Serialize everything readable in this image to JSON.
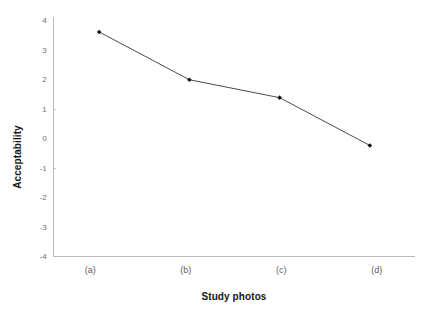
{
  "chart_data": {
    "type": "line",
    "title": "",
    "subtitle": "",
    "xlabel": "Study photos",
    "ylabel": "Acceptability",
    "categories": [
      "(a)",
      "(b)",
      "(c)",
      "(d)"
    ],
    "values": [
      3.5,
      1.9,
      1.3,
      -0.3
    ],
    "series": [
      {
        "name": "Acceptability",
        "values": [
          3.5,
          1.9,
          1.3,
          -0.3
        ]
      }
    ],
    "ylim": [
      -4,
      4
    ],
    "y_ticks": [
      4,
      3,
      2,
      1,
      0,
      -1,
      -2,
      -3,
      -4
    ],
    "y_tick_labels": [
      "4",
      "3",
      "2",
      "1",
      "0",
      "-1",
      "-2",
      "-3",
      "-4"
    ],
    "x_tick_labels": [
      "(a)",
      "(b)",
      "(c)",
      "(d)"
    ],
    "grid": false,
    "legend": null,
    "legend_position": "none",
    "annotations": [],
    "marker": "diamond",
    "line_color": "#4a4a4a",
    "marker_color": "#111111",
    "axis_color": "#b9b9b9",
    "background_color": "#ffffff"
  }
}
